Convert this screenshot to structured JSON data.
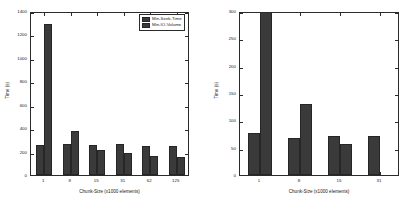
{
  "figure": {
    "background_color": "#ffffff",
    "bar_color": "#3a3a3a",
    "axis_color": "#2b2b2b"
  },
  "legend": {
    "position": "top-right",
    "entries": [
      {
        "label": "Min-Seek-Time",
        "color": "#3a3a3a"
      },
      {
        "label": "Min-IO-Volume",
        "color": "#3a3a3a"
      }
    ]
  },
  "chart_data": [
    {
      "id": "left",
      "type": "bar",
      "title": "",
      "xlabel": "Chunk-Size (x1000 elements)",
      "ylabel": "Time (s)",
      "categories": [
        "1",
        "8",
        "15",
        "31",
        "62",
        "125"
      ],
      "series": [
        {
          "name": "Min-Seek-Time",
          "values": [
            258,
            262,
            252,
            261,
            250,
            245
          ]
        },
        {
          "name": "Min-IO-Volume",
          "values": [
            1288,
            374,
            217,
            192,
            166,
            152
          ]
        }
      ],
      "ylim": [
        0,
        1400
      ],
      "yticks": [
        0,
        200,
        400,
        600,
        800,
        1000,
        1200,
        1400
      ],
      "ytick_labels": [
        "0",
        "200",
        "400",
        "600",
        "800",
        "1000",
        "1200",
        "1400"
      ],
      "grid": false,
      "legend_position": "upper right"
    },
    {
      "id": "right",
      "type": "bar",
      "title": "",
      "xlabel": "Chunk-Size (x1000 elements)",
      "ylabel": "Time (s)",
      "categories": [
        "1",
        "8",
        "15",
        "31"
      ],
      "series": [
        {
          "name": "Min-Seek-Time",
          "values": [
            77,
            68,
            71,
            71
          ]
        },
        {
          "name": "Min-IO-Volume",
          "values": [
            300,
            130,
            57,
            0
          ]
        }
      ],
      "ylim": [
        0,
        300
      ],
      "yticks": [
        0,
        50,
        100,
        150,
        200,
        250,
        300
      ],
      "ytick_labels": [
        "0",
        "50",
        "100",
        "150",
        "200",
        "250",
        "300"
      ],
      "grid": false,
      "legend_position": "none",
      "note_clipped_right": true
    }
  ]
}
